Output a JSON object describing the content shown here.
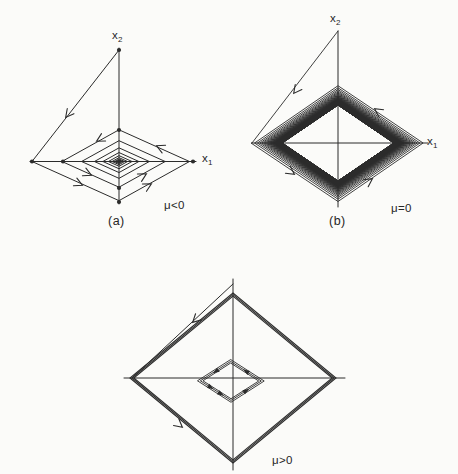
{
  "style": {
    "background": "#fbfbf9",
    "ink": "#2b2b2b"
  },
  "figure_a": {
    "caption": "(a)",
    "mu_label": "μ<0",
    "axis_x1": {
      "base": "x",
      "sub": "1"
    },
    "axis_x2": {
      "base": "x",
      "sub": "2"
    },
    "geometry": {
      "center": [
        119,
        161.5
      ],
      "axes": {
        "h": [
          30,
          161.5,
          196,
          161.5
        ],
        "v": [
          119,
          48,
          119,
          204
        ]
      },
      "entry": [
        [
          119,
          50
        ],
        [
          32,
          161.5
        ]
      ],
      "spiral": {
        "mode": "exp",
        "rx0": 87,
        "ry_ratio": 0.5,
        "factor": 0.9,
        "quarters": 40
      },
      "dots": [
        [
          119,
          50
        ],
        [
          32,
          161.5
        ],
        [
          119,
          202
        ],
        [
          193,
          161.5
        ],
        [
          119,
          130
        ],
        [
          63,
          161.5
        ],
        [
          119,
          188
        ]
      ],
      "arrows": [
        {
          "x": 66,
          "y": 117,
          "angle": 127.8,
          "type": "chevron"
        },
        {
          "x": 97,
          "y": 141,
          "angle": 150.7,
          "type": "chevron"
        },
        {
          "x": 157,
          "y": 146,
          "angle": 204.6,
          "type": "chevron"
        },
        {
          "x": 82,
          "y": 185,
          "angle": 24.2,
          "type": "chevron"
        },
        {
          "x": 91,
          "y": 175,
          "angle": 24.5,
          "type": "chevron"
        },
        {
          "x": 151,
          "y": 184,
          "angle": -29.1,
          "type": "chevron"
        },
        {
          "x": 146,
          "y": 174,
          "angle": -29.5,
          "type": "chevron"
        }
      ]
    }
  },
  "figure_b": {
    "caption": "(b)",
    "mu_label": "μ=0",
    "axis_x1": {
      "base": "x",
      "sub": "1"
    },
    "axis_x2": {
      "base": "x",
      "sub": "2"
    },
    "geometry": {
      "center": [
        338,
        143
      ],
      "axes": {
        "h": [
          252,
          143,
          428,
          143
        ],
        "v": [
          338,
          31,
          338,
          207
        ]
      },
      "entry": [
        [
          338,
          31
        ],
        [
          252,
          143
        ]
      ],
      "spiral": {
        "mode": "approach",
        "rx0": 87,
        "rx_in": 53.5,
        "ry_ratio": 0.68,
        "b": 0.03,
        "quarters": 440
      },
      "dots": [],
      "arrows": [
        {
          "x": 294,
          "y": 93,
          "angle": 127.5,
          "type": "chevron"
        },
        {
          "x": 375,
          "y": 109,
          "angle": 214.4,
          "type": "chevron"
        },
        {
          "x": 294,
          "y": 174,
          "angle": 34.4,
          "type": "chevron"
        },
        {
          "x": 372,
          "y": 179,
          "angle": -34.4,
          "type": "chevron"
        }
      ]
    }
  },
  "figure_c": {
    "mu_label": "μ>0",
    "geometry": {
      "center": [
        233,
        378
      ],
      "axes": {
        "h": [
          124,
          378,
          345,
          378
        ],
        "v": [
          233,
          279,
          233,
          470
        ]
      },
      "entry": [
        [
          233,
          284
        ],
        [
          132,
          378
        ]
      ],
      "outer_diamonds": {
        "center": [
          233,
          378
        ],
        "ry_ratio": 0.825,
        "rx": [
          103,
          101,
          99.2
        ]
      },
      "inner_diamonds": {
        "center": [
          231,
          381
        ],
        "ry_ratio": 0.64,
        "rx": [
          33.2,
          30.3,
          27.7
        ]
      },
      "dots": [],
      "arrows": [
        {
          "x": 193,
          "y": 322,
          "angle": 136.5,
          "type": "chevron"
        },
        {
          "x": 182,
          "y": 427,
          "angle": 39.5,
          "type": "chevron"
        },
        {
          "x": 215.9,
          "y": 371.3,
          "angle": 147.4,
          "type": "triangle"
        },
        {
          "x": 246.2,
          "y": 371.3,
          "angle": 212.6,
          "type": "triangle"
        },
        {
          "x": 210.7,
          "y": 387.4,
          "angle": 32.6,
          "type": "triangle"
        },
        {
          "x": 220.7,
          "y": 393.8,
          "angle": 32.6,
          "type": "triangle"
        },
        {
          "x": 246.2,
          "y": 390.7,
          "angle": -32.6,
          "type": "triangle"
        }
      ]
    }
  }
}
